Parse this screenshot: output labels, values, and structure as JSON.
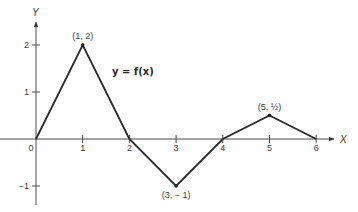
{
  "chart_data": {
    "type": "line",
    "title": "",
    "function_label": "y = f(x)",
    "xlabel": "X",
    "ylabel": "Y",
    "xlim": [
      0,
      6.4
    ],
    "ylim": [
      -1.4,
      2.5
    ],
    "grid": false,
    "legend": "none",
    "x_ticks": [
      0,
      1,
      2,
      3,
      4,
      5,
      6
    ],
    "x_tick_labels": [
      "0",
      "1",
      "2",
      "3",
      "4",
      "5",
      "6"
    ],
    "y_ticks": [
      2,
      1,
      -1
    ],
    "y_tick_labels": [
      "2",
      "1",
      "−1"
    ],
    "series": [
      {
        "name": "f(x)",
        "x": [
          0,
          1,
          2,
          3,
          4,
          5,
          6
        ],
        "y": [
          0,
          2,
          0,
          -1,
          0,
          0.5,
          0
        ]
      }
    ],
    "annotations": [
      {
        "x": 1,
        "y": 2,
        "text": "(1, 2)"
      },
      {
        "x": 3,
        "y": -1,
        "text": "(3, − 1)"
      },
      {
        "x": 5,
        "y": 0.5,
        "text": "(5, ½)"
      }
    ]
  },
  "layout": {
    "origin_px": [
      36,
      139
    ],
    "unit_x_px": 46.7,
    "unit_y_px": 47,
    "ink_color": "#2a2a2a",
    "axis_color": "#4a4a4a"
  }
}
